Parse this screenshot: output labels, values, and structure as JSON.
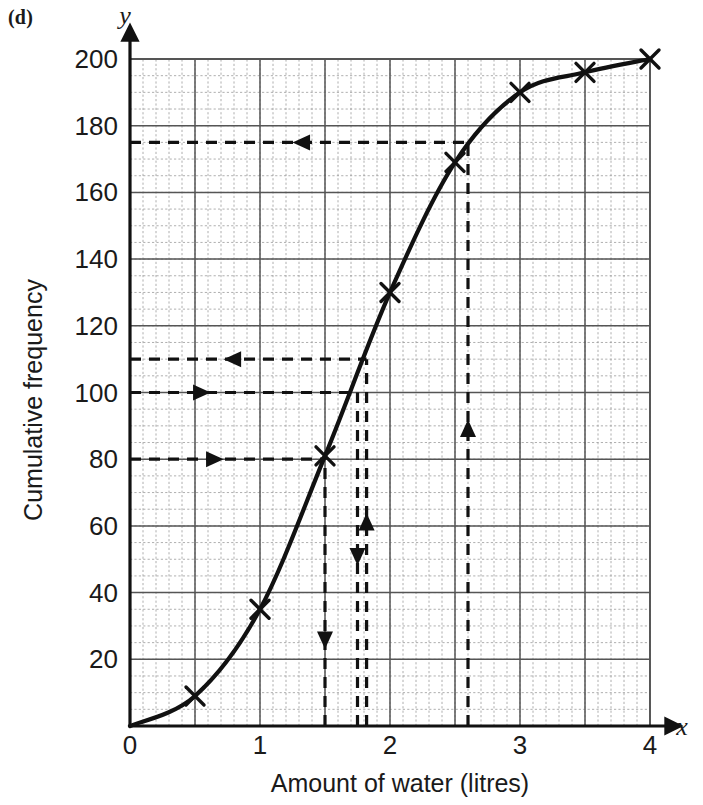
{
  "part_label": "(d)",
  "chart_data": {
    "type": "line",
    "title": "",
    "xlabel": "Amount of water (litres)",
    "ylabel": "Cumulative frequency",
    "x_axis_name": "x",
    "y_axis_name": "y",
    "xlim": [
      0,
      4
    ],
    "ylim": [
      0,
      200
    ],
    "x_ticks": [
      0,
      1,
      2,
      3,
      4
    ],
    "x_tick_labels": [
      "0",
      "1",
      "2",
      "3",
      "4"
    ],
    "y_ticks": [
      0,
      20,
      40,
      60,
      80,
      100,
      120,
      140,
      160,
      180,
      200
    ],
    "y_tick_labels": [
      "0",
      "20",
      "40",
      "60",
      "80",
      "100",
      "120",
      "140",
      "160",
      "180",
      "200"
    ],
    "grid": true,
    "grid_major_x_step": 0.5,
    "grid_major_y_step": 20,
    "grid_minor_x_step": 0.1,
    "grid_minor_y_step": 5,
    "legend": null,
    "x": [
      0,
      0.5,
      1.0,
      1.5,
      2.0,
      2.5,
      3.0,
      3.5,
      4.0
    ],
    "values": [
      0,
      9,
      35,
      81,
      130,
      169,
      190,
      196,
      200
    ],
    "marker": "x-cross",
    "marker_points": [
      {
        "x": 0.5,
        "y": 9
      },
      {
        "x": 1.0,
        "y": 35
      },
      {
        "x": 1.5,
        "y": 81
      },
      {
        "x": 2.0,
        "y": 130
      },
      {
        "x": 2.5,
        "y": 169
      },
      {
        "x": 3.0,
        "y": 190
      },
      {
        "x": 3.5,
        "y": 196
      },
      {
        "x": 4.0,
        "y": 200
      }
    ],
    "annotations": [
      {
        "name": "read-175-horizontal",
        "type": "dashed-horizontal",
        "y": 175,
        "from_x": 0,
        "to_x": 2.6,
        "arrow": "left",
        "arrow_at_x": 1.35
      },
      {
        "name": "read-175-vertical",
        "type": "dashed-vertical",
        "x": 2.6,
        "from_y": 0,
        "to_y": 175,
        "arrow": "up",
        "arrow_at_y": 88
      },
      {
        "name": "read-110-horizontal",
        "type": "dashed-horizontal",
        "y": 110,
        "from_x": 0,
        "to_x": 1.82,
        "arrow": "left",
        "arrow_at_x": 0.82
      },
      {
        "name": "read-110-vertical",
        "type": "dashed-vertical",
        "x": 1.82,
        "from_y": 0,
        "to_y": 110,
        "arrow": "up",
        "arrow_at_y": 60
      },
      {
        "name": "read-100-horizontal",
        "type": "dashed-horizontal",
        "y": 100,
        "from_x": 0,
        "to_x": 1.75,
        "arrow": "right",
        "arrow_at_x": 0.52
      },
      {
        "name": "read-100-vertical",
        "type": "dashed-vertical",
        "x": 1.75,
        "from_y": 0,
        "to_y": 100,
        "arrow": "down",
        "arrow_at_y": 52
      },
      {
        "name": "read-80-horizontal",
        "type": "dashed-horizontal",
        "y": 80,
        "from_x": 0,
        "to_x": 1.5,
        "arrow": "right",
        "arrow_at_x": 0.62
      },
      {
        "name": "read-80-vertical",
        "type": "dashed-vertical",
        "x": 1.5,
        "from_y": 0,
        "to_y": 80,
        "arrow": "down",
        "arrow_at_y": 27
      }
    ],
    "colors": {
      "curve": "#111111",
      "axis": "#111111",
      "grid_major": "#555555",
      "grid_minor": "#9a9a9a",
      "dashed": "#111111",
      "text": "#1a1a1a",
      "background": "#ffffff"
    }
  }
}
